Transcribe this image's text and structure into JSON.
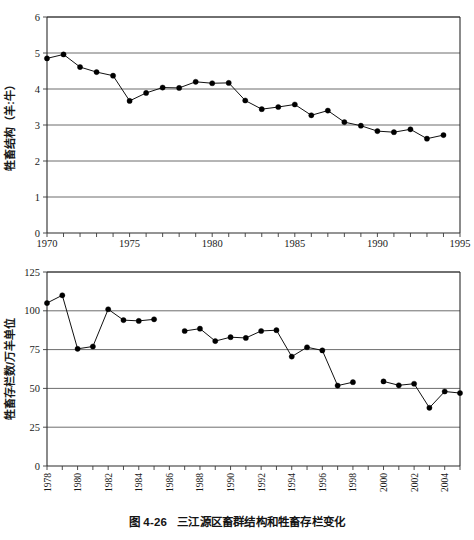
{
  "figure": {
    "caption": "图 4-26   三江源区畜群结构和牲畜存栏变化",
    "caption_number": "图 4-26",
    "caption_text": "三江源区畜群结构和牲畜存栏变化"
  },
  "chart_data": [
    {
      "id": "livestock-structure",
      "type": "line",
      "title": "",
      "xlabel": "",
      "ylabel": "牲畜结构（羊:牛）",
      "xlim": [
        1970,
        1995
      ],
      "ylim": [
        0,
        6
      ],
      "ytick_values": [
        0,
        1,
        2,
        3,
        4,
        5,
        6
      ],
      "ytick_labels": [
        "0",
        "1",
        "2",
        "3",
        "4",
        "5",
        "6"
      ],
      "xtick_values": [
        1970,
        1975,
        1980,
        1985,
        1990,
        1995
      ],
      "xtick_labels": [
        "1970",
        "1975",
        "1980",
        "1985",
        "1990",
        "1995"
      ],
      "xtick_minor_step": 1,
      "grid": "horizontal",
      "legend": "none",
      "marker": "filled-circle",
      "x": [
        1970,
        1971,
        1972,
        1973,
        1974,
        1975,
        1976,
        1977,
        1978,
        1979,
        1980,
        1981,
        1982,
        1983,
        1984,
        1985,
        1986,
        1987,
        1988,
        1989,
        1990,
        1991,
        1992,
        1993,
        1994
      ],
      "values": [
        4.85,
        4.96,
        4.61,
        4.47,
        4.37,
        3.67,
        3.89,
        4.04,
        4.03,
        4.2,
        4.16,
        4.17,
        3.68,
        3.44,
        3.5,
        3.57,
        3.27,
        3.4,
        3.08,
        2.98,
        2.83,
        2.8,
        2.88,
        2.62,
        2.72,
        2.75
      ]
    },
    {
      "id": "livestock-stock",
      "type": "line",
      "title": "",
      "xlabel": "",
      "ylabel": "牲畜存栏数/万羊单位",
      "xlim": [
        1978,
        2005
      ],
      "ylim": [
        0,
        125
      ],
      "ytick_values": [
        0,
        25,
        50,
        75,
        100,
        125
      ],
      "ytick_labels": [
        "0",
        "25",
        "50",
        "75",
        "100",
        "125"
      ],
      "xtick_values": [
        1978,
        1980,
        1982,
        1984,
        1986,
        1988,
        1990,
        1992,
        1994,
        1996,
        1998,
        2000,
        2002,
        2004
      ],
      "xtick_labels": [
        "1978",
        "1980",
        "1982",
        "1984",
        "1986",
        "1988",
        "1990",
        "1992",
        "1994",
        "1996",
        "1998",
        "2000",
        "2002",
        "2004"
      ],
      "xtick_minor_step": 1,
      "grid": "horizontal",
      "legend": "none",
      "marker": "filled-circle",
      "segments": [
        {
          "x": [
            1978,
            1979,
            1980,
            1981,
            1982,
            1983,
            1984,
            1985
          ],
          "values": [
            105.0,
            110.0,
            75.5,
            77.0,
            101.0,
            94.0,
            93.5,
            94.5
          ]
        },
        {
          "x": [
            1987,
            1988,
            1989,
            1990,
            1991,
            1992,
            1993,
            1994,
            1995,
            1996,
            1997,
            1998
          ],
          "values": [
            87.0,
            88.5,
            80.5,
            83.0,
            82.5,
            87.0,
            87.5,
            70.5,
            76.5,
            74.5,
            51.8,
            54.0
          ]
        },
        {
          "x": [
            2000,
            2001,
            2002,
            2003,
            2004,
            2005
          ],
          "values": [
            54.5,
            52.0,
            53.0,
            37.5,
            48.0,
            47.0
          ]
        }
      ]
    }
  ]
}
